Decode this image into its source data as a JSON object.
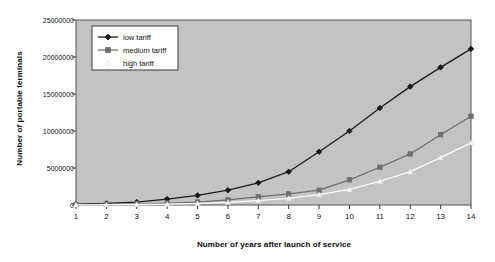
{
  "chart_data": {
    "type": "line",
    "title": "",
    "xlabel": "Number of years after launch of service",
    "ylabel": "Number of portable terminals",
    "x": [
      1,
      2,
      3,
      4,
      5,
      6,
      7,
      8,
      9,
      10,
      11,
      12,
      13,
      14
    ],
    "xtick_labels": [
      "1",
      "2",
      "3",
      "4",
      "5",
      "6",
      "7",
      "8",
      "9",
      "10",
      "11",
      "12",
      "13",
      "14"
    ],
    "ytick_labels": [
      "0",
      "5000000",
      "10000000",
      "15000000",
      "20000000",
      "25000000"
    ],
    "ytick_values": [
      0,
      5000000,
      10000000,
      15000000,
      20000000,
      25000000
    ],
    "xlim": [
      1,
      14
    ],
    "ylim": [
      0,
      25000000
    ],
    "grid": false,
    "legend_position": "top-left",
    "plot_background": "#c3c3c3",
    "series": [
      {
        "name": "low tariff",
        "color": "#1a1a1a",
        "marker": "diamond",
        "values": [
          100000,
          200000,
          400000,
          800000,
          1300000,
          2000000,
          3000000,
          4500000,
          7200000,
          10000000,
          13100000,
          16000000,
          18600000,
          21100000
        ]
      },
      {
        "name": "medium tariff",
        "color": "#6e6e6e",
        "marker": "square",
        "values": [
          50000,
          100000,
          150000,
          250000,
          400000,
          700000,
          1100000,
          1500000,
          2000000,
          3400000,
          5100000,
          6900000,
          9500000,
          12000000
        ]
      },
      {
        "name": "high tariff",
        "color": "#fcfcfc",
        "marker": "triangle",
        "values": [
          20000,
          40000,
          70000,
          120000,
          200000,
          350000,
          600000,
          900000,
          1400000,
          2100000,
          3200000,
          4500000,
          6400000,
          8400000
        ]
      }
    ]
  },
  "legend": {
    "items": [
      {
        "label": "low tariff"
      },
      {
        "label": "medium tariff"
      },
      {
        "label": "high tariff"
      }
    ]
  }
}
